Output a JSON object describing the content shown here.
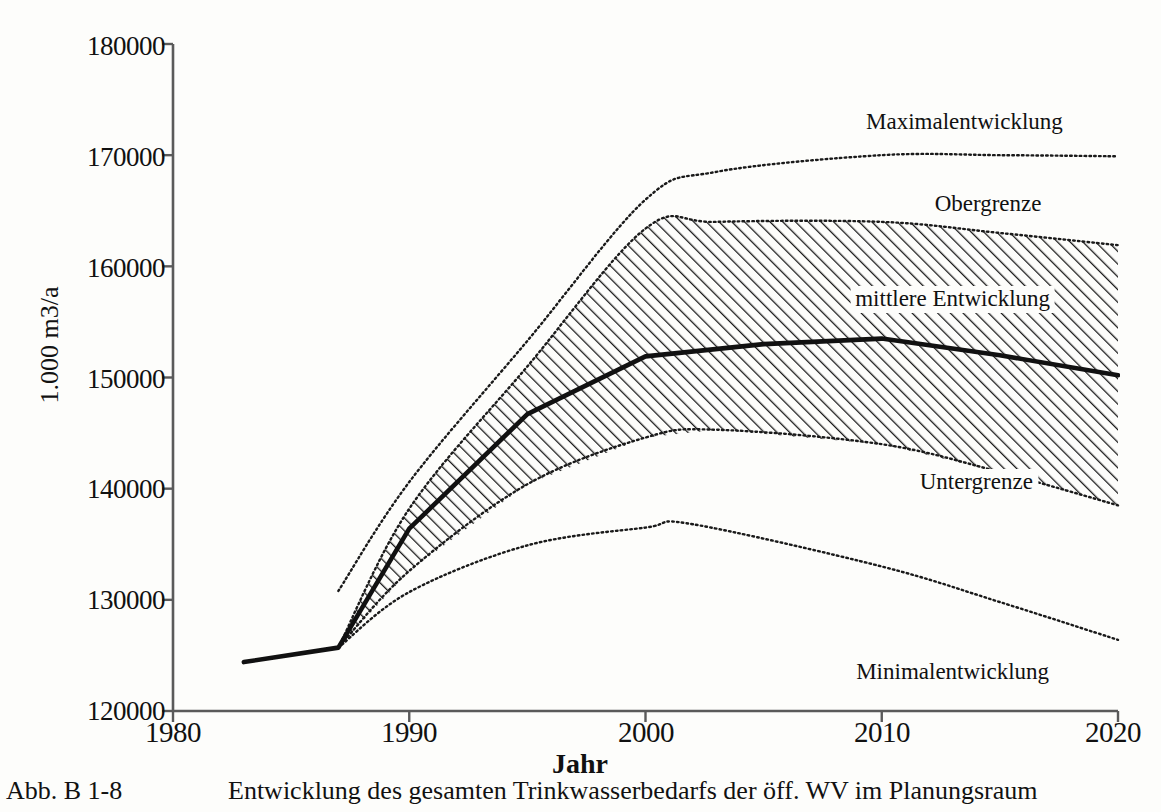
{
  "figure": {
    "caption_id": "Abb. B 1-8",
    "caption_text": "Entwicklung des gesamten Trinkwasserbedarfs der öff. WV im Planungsraum"
  },
  "chart_data": {
    "type": "line",
    "title": "",
    "xlabel": "Jahr",
    "ylabel": "1.000 m3/a",
    "xlim": [
      1980,
      2020
    ],
    "ylim": [
      120000,
      180000
    ],
    "xticks": [
      1980,
      1990,
      2000,
      2010,
      2020
    ],
    "yticks": [
      120000,
      130000,
      140000,
      150000,
      160000,
      170000,
      180000
    ],
    "ytick_labels": [
      "120000",
      "130000",
      "140000",
      "150000",
      "160000",
      "170000",
      "180000"
    ],
    "xtick_labels": [
      "1980",
      "1990",
      "2000",
      "2010",
      "2020"
    ],
    "grid": false,
    "legend": "inline-annotations",
    "series": [
      {
        "name": "Maximalentwicklung",
        "style": "dotted",
        "x": [
          1987.0,
          1990.0,
          1995.0,
          2000.0,
          2003.0,
          2010.0,
          2015.0,
          2020.0
        ],
        "values": [
          130800,
          140600,
          153300,
          166000,
          168500,
          170000,
          170000,
          169900
        ]
      },
      {
        "name": "Obergrenze",
        "style": "dotted-band-top",
        "x": [
          1987.0,
          1990.0,
          1995.0,
          2000.0,
          2003.0,
          2010.0,
          2015.0,
          2020.0
        ],
        "values": [
          125700,
          138200,
          151000,
          163400,
          164000,
          164000,
          163000,
          161900
        ]
      },
      {
        "name": "mittlere Entwicklung",
        "style": "solid-bold",
        "x": [
          1983.0,
          1987.0,
          1990.0,
          1995.0,
          2000.0,
          2005.0,
          2010.0,
          2015.0,
          2020.0
        ],
        "values": [
          124400,
          125700,
          136400,
          146700,
          151900,
          153000,
          153500,
          152000,
          150200
        ]
      },
      {
        "name": "Untergrenze",
        "style": "dotted-band-bottom",
        "x": [
          1987.0,
          1990.0,
          1995.0,
          2000.0,
          2003.0,
          2010.0,
          2015.0,
          2020.0
        ],
        "values": [
          125700,
          132600,
          140400,
          144600,
          145300,
          144000,
          141500,
          138500
        ]
      },
      {
        "name": "Minimalentwicklung",
        "style": "dotted",
        "x": [
          1987.0,
          1990.0,
          1995.0,
          2000.0,
          2002.0,
          2010.0,
          2015.0,
          2020.0
        ],
        "values": [
          125700,
          130700,
          134900,
          136500,
          136800,
          133000,
          129800,
          126400
        ]
      }
    ],
    "bands": [
      {
        "name": "upper-band",
        "between": [
          "Obergrenze",
          "mittlere Entwicklung"
        ],
        "hatch": "diagonal-forward"
      },
      {
        "name": "lower-band",
        "between": [
          "mittlere Entwicklung",
          "Untergrenze"
        ],
        "hatch": "diagonal-forward"
      }
    ],
    "annotations": [
      {
        "name": "Maximalentwicklung",
        "text": "Maximalentwicklung",
        "x": 2013.5,
        "y": 172700
      },
      {
        "name": "Obergrenze",
        "text": "Obergrenze",
        "x": 2014.5,
        "y": 165300
      },
      {
        "name": "mittlere Entwicklung",
        "text": "mittlere Entwicklung",
        "x": 2013.0,
        "y": 156800
      },
      {
        "name": "Untergrenze",
        "text": "Untergrenze",
        "x": 2014.0,
        "y": 140300
      },
      {
        "name": "Minimalentwicklung",
        "text": "Minimalentwicklung",
        "x": 2013.0,
        "y": 123200
      }
    ]
  },
  "colors": {
    "ink": "#111111",
    "paper": "#fdfdfb",
    "axis": "#555555"
  }
}
